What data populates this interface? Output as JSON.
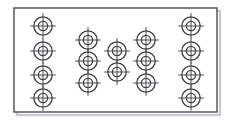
{
  "image": {
    "width": 231,
    "height": 122,
    "background_color": "#ffffff",
    "title": "Crosshair target symbol array inside rectangular frame",
    "description": "Line-art technical diagram: a thin rectangular outline frame with a faint drop shadow, containing sixteen concentric-circle crosshair symbols arranged in five vertical columns forming a lens or diamond shaped array."
  },
  "frame": {
    "name": "outer rectangle border",
    "x": 14,
    "y": 8,
    "width": 203,
    "height": 104,
    "stroke_color": "#4a4a52",
    "stroke_width": 1.4,
    "fill_color": "#ffffff",
    "shadow_color": "#c9c9cf",
    "shadow_offset_x": 3,
    "shadow_offset_y": 3
  },
  "symbol": {
    "name": "crosshair target",
    "outer_radius": 9.2,
    "inner_radius": 4.6,
    "tick_overhang": 3.6,
    "stroke_color": "#3f3f47",
    "stroke_width": 1.3,
    "fill_color": "#ffffff",
    "count_total": 16
  },
  "columns": [
    {
      "label": "column-1",
      "index": 1,
      "center_x": 43,
      "count": 4,
      "centers_y": [
        26,
        51,
        75,
        98
      ]
    },
    {
      "label": "column-2",
      "index": 2,
      "center_x": 88,
      "count": 3,
      "centers_y": [
        40,
        61,
        83
      ]
    },
    {
      "label": "column-3",
      "index": 3,
      "center_x": 117,
      "count": 2,
      "centers_y": [
        51,
        72
      ]
    },
    {
      "label": "column-4",
      "index": 4,
      "center_x": 146,
      "count": 3,
      "centers_y": [
        40,
        61,
        83
      ]
    },
    {
      "label": "column-5",
      "index": 5,
      "center_x": 191,
      "count": 4,
      "centers_y": [
        26,
        51,
        75,
        98
      ]
    }
  ],
  "layout_notes": {
    "pattern": "4-3-2-3-4",
    "symmetry": "left-right mirrored about the vertical centerline",
    "grid": "off",
    "legend": "none",
    "axis_labels": "none",
    "text_labels": "none"
  }
}
